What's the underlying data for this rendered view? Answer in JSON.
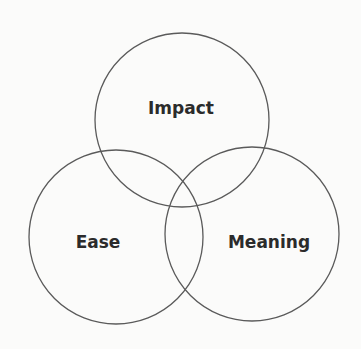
{
  "diagram": {
    "type": "venn",
    "background": "#fbfbfa",
    "stroke_color": "#5a5a5a",
    "text_color": "#2b2b2b",
    "circles": [
      {
        "id": "impact",
        "label": "Impact",
        "cx": 182,
        "cy": 120,
        "r": 87,
        "label_x": 181,
        "label_y": 114
      },
      {
        "id": "ease",
        "label": "Ease",
        "cx": 116,
        "cy": 237,
        "r": 87,
        "label_x": 98,
        "label_y": 248
      },
      {
        "id": "meaning",
        "label": "Meaning",
        "cx": 252,
        "cy": 234,
        "r": 87,
        "label_x": 269,
        "label_y": 248
      }
    ]
  }
}
